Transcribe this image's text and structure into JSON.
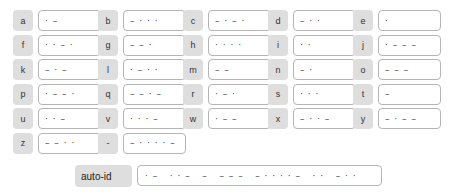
{
  "fields": [
    {
      "label": "a",
      "value": "· –"
    },
    {
      "label": "b",
      "value": "– · · ·"
    },
    {
      "label": "c",
      "value": "– · – ·"
    },
    {
      "label": "d",
      "value": "– · ·"
    },
    {
      "label": "e",
      "value": "·"
    },
    {
      "label": "f",
      "value": "· · – ·"
    },
    {
      "label": "g",
      "value": "– – ·"
    },
    {
      "label": "h",
      "value": "· · · ·"
    },
    {
      "label": "i",
      "value": "· ·"
    },
    {
      "label": "j",
      "value": "· – – –"
    },
    {
      "label": "k",
      "value": "– · –"
    },
    {
      "label": "l",
      "value": "· – · ·"
    },
    {
      "label": "m",
      "value": "– –"
    },
    {
      "label": "n",
      "value": "– ·"
    },
    {
      "label": "o",
      "value": "– – –"
    },
    {
      "label": "p",
      "value": "· – – ·"
    },
    {
      "label": "q",
      "value": "– – · –"
    },
    {
      "label": "r",
      "value": "· – ·"
    },
    {
      "label": "s",
      "value": "· · ·"
    },
    {
      "label": "t",
      "value": "–"
    },
    {
      "label": "u",
      "value": "· · –"
    },
    {
      "label": "v",
      "value": "· · · –"
    },
    {
      "label": "w",
      "value": "· – –"
    },
    {
      "label": "x",
      "value": "– · · –"
    },
    {
      "label": "y",
      "value": "– · – –"
    },
    {
      "label": "z",
      "value": "– – · ·"
    },
    {
      "label": "-",
      "value": "– · · · · –"
    }
  ],
  "auto_id": {
    "label": "auto-id",
    "value": "· –   · · –   –   – – –   – · · · · –   · ·   – · ·"
  }
}
